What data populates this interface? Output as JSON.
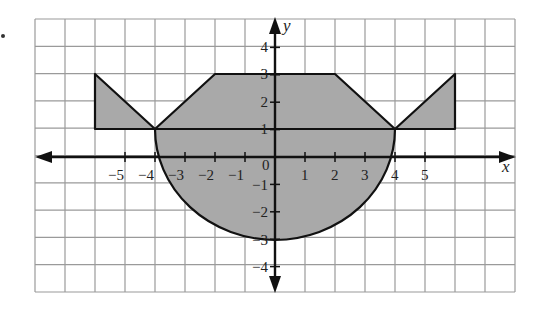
{
  "figure": {
    "x_axis_label": "x",
    "y_axis_label": "y",
    "origin_label": "0",
    "x_tick_labels": [
      "−5",
      "−4",
      "−3",
      "−2",
      "−1",
      "1",
      "2",
      "3",
      "4",
      "5"
    ],
    "y_tick_labels": [
      "4",
      "3",
      "2",
      "1",
      "−1",
      "−2",
      "−3",
      "−4"
    ],
    "colors": {
      "fill": "#a9a9a9",
      "grid": "#9a9a9a",
      "axis": "#111111"
    }
  },
  "chart_data": {
    "type": "diagram",
    "title": "",
    "xlabel": "x",
    "ylabel": "y",
    "xlim": [
      -8,
      8
    ],
    "ylim": [
      -5,
      5
    ],
    "grid": true,
    "shapes": [
      {
        "name": "trapezium",
        "vertices": [
          [
            -4,
            1
          ],
          [
            -2,
            3
          ],
          [
            2,
            3
          ],
          [
            4,
            1
          ]
        ]
      },
      {
        "name": "curved-bottom",
        "from": [
          -4,
          1
        ],
        "through": [
          0,
          -3
        ],
        "to": [
          4,
          1
        ]
      },
      {
        "name": "left-triangle",
        "vertices": [
          [
            -6,
            1
          ],
          [
            -6,
            2
          ],
          [
            -4,
            1
          ]
        ]
      },
      {
        "name": "right-triangle",
        "vertices": [
          [
            4,
            1
          ],
          [
            6,
            2
          ],
          [
            6,
            1
          ]
        ]
      },
      {
        "name": "line-y1",
        "from": [
          -6,
          1
        ],
        "to": [
          6,
          1
        ]
      }
    ]
  }
}
